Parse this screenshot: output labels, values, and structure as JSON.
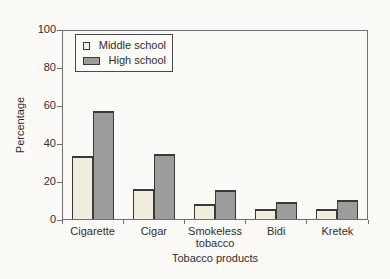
{
  "figure": {
    "background": "#fbfaf7",
    "frame_color": "#6f6f6f",
    "text_color": "#2e2e2e"
  },
  "chart_data": {
    "type": "bar",
    "xlabel": "Tobacco products",
    "ylabel": "Percentage",
    "categories": [
      "Cigarette",
      "Cigar",
      "Smokeless tobacco",
      "Bidi",
      "Kretek"
    ],
    "series": [
      {
        "name": "Middle school",
        "color": "#f1eddd",
        "values": [
          33,
          16,
          8,
          5,
          5
        ]
      },
      {
        "name": "High school",
        "color": "#9c9c9c",
        "values": [
          57,
          34,
          15,
          9,
          10
        ]
      }
    ],
    "ylim": [
      0,
      100
    ],
    "yticks": [
      0,
      20,
      40,
      60,
      80,
      100
    ],
    "grid": false,
    "legend_position": "upper-left",
    "bar_border_color": "#3a3a3a"
  }
}
